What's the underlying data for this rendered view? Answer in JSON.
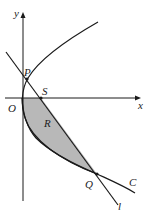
{
  "diagram": {
    "type": "parabola-line-region",
    "colors": {
      "stroke": "#1a1a1a",
      "shading": "#b8b8b8",
      "background": "#ffffff"
    },
    "axes": {
      "x_label": "x",
      "y_label": "y",
      "origin_label": "O"
    },
    "points": {
      "P": "P",
      "S": "S",
      "Q": "Q"
    },
    "curve_label": "C",
    "line_label": "l",
    "region_label": "R"
  }
}
